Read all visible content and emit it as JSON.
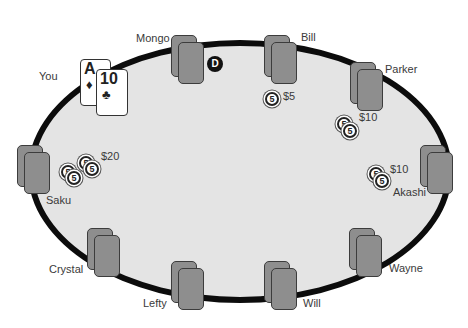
{
  "table": {
    "felt_color": "#e4e4e4",
    "rail_color": "#0c0c0c"
  },
  "dealer_button": {
    "label": "D"
  },
  "hero": {
    "name": "You",
    "cards": [
      {
        "rank": "A",
        "suit": "♦",
        "suit_name": "diamonds"
      },
      {
        "rank": "10",
        "suit": "♣",
        "suit_name": "clubs"
      }
    ]
  },
  "players": [
    {
      "name": "Mongo"
    },
    {
      "name": "Bill",
      "bet": "$5",
      "chips": [
        "5"
      ]
    },
    {
      "name": "Parker",
      "bet": "$10",
      "chips": [
        "5",
        "5"
      ]
    },
    {
      "name": "Akashi",
      "bet": "$10",
      "chips": [
        "5",
        "5"
      ]
    },
    {
      "name": "Wayne"
    },
    {
      "name": "Will"
    },
    {
      "name": "Lefty"
    },
    {
      "name": "Crystal"
    },
    {
      "name": "Saku",
      "bet": "$20",
      "chips": [
        "5",
        "5",
        "5",
        "5"
      ]
    }
  ]
}
